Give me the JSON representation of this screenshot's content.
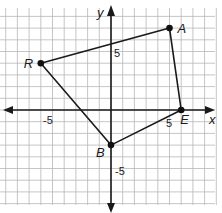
{
  "diagram": {
    "type": "coordinate-plane-polygon",
    "axes": {
      "x_label": "x",
      "y_label": "y",
      "ticks": [
        {
          "axis": "x",
          "value": -5,
          "label": "-5"
        },
        {
          "axis": "x",
          "value": 5,
          "label": "5"
        },
        {
          "axis": "y",
          "value": 5,
          "label": "5"
        },
        {
          "axis": "y",
          "value": -5,
          "label": "-5"
        }
      ]
    },
    "points": [
      {
        "name": "A",
        "x": 5,
        "y": 7
      },
      {
        "name": "E",
        "x": 6,
        "y": 0
      },
      {
        "name": "B",
        "x": 0,
        "y": -3
      },
      {
        "name": "R",
        "x": -6,
        "y": 4
      }
    ],
    "polygon_order": [
      "R",
      "A",
      "E",
      "B"
    ],
    "colors": {
      "grid": "#b8b8b8",
      "axis": "#1a1a1a",
      "line": "#1a1a1a",
      "point": "#111111"
    }
  }
}
